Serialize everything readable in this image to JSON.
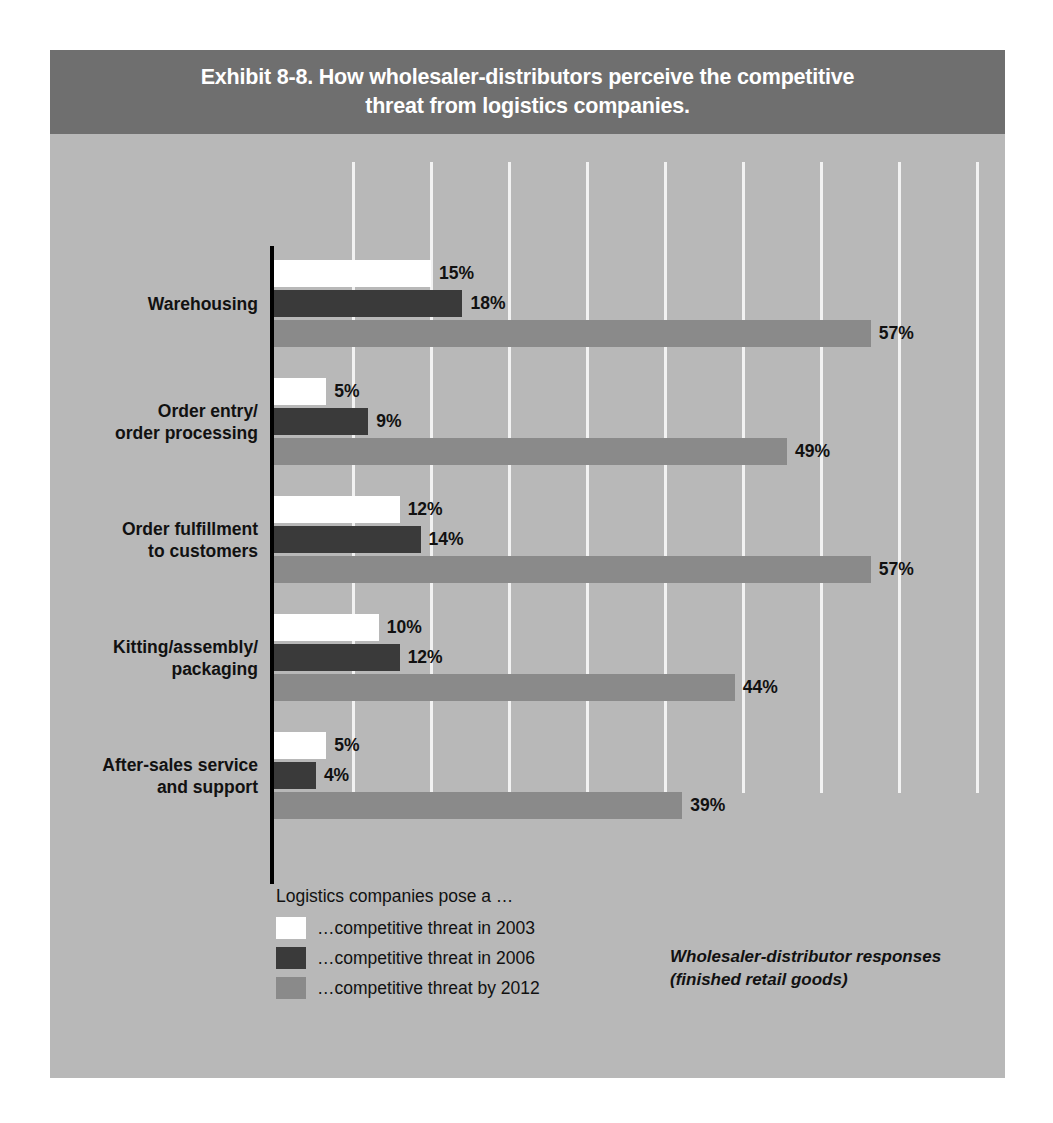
{
  "exhibit": {
    "title": "Exhibit 8-8. How wholesaler-distributors perceive the competitive\nthreat from logistics companies."
  },
  "legend": {
    "title": "Logistics companies pose a …",
    "entries": [
      {
        "key": "s2003",
        "label": "…competitive threat in 2003",
        "color": "#ffffff"
      },
      {
        "key": "s2006",
        "label": "…competitive threat in 2006",
        "color": "#3a3a3a"
      },
      {
        "key": "s2012",
        "label": "…competitive threat by 2012",
        "color": "#8a8a8a"
      }
    ]
  },
  "source_note": "Wholesaler-distributor responses\n(finished retail goods)",
  "colors": {
    "panel_background": "#b8b8b8",
    "title_band": "#6f6f6f",
    "title_text": "#ffffff",
    "gridline": "#f2f2f2",
    "axis": "#000000",
    "series_2003": "#ffffff",
    "series_2006": "#3a3a3a",
    "series_2012": "#8a8a8a",
    "label_text": "#111111"
  },
  "chart_data": {
    "type": "bar",
    "orientation": "horizontal",
    "title": "Exhibit 8-8. How wholesaler-distributors perceive the competitive threat from logistics companies.",
    "xlabel": "",
    "ylabel": "",
    "xlim": [
      0,
      70
    ],
    "grid": true,
    "gridline_count": 9,
    "legend_position": "bottom-left",
    "value_suffix": "%",
    "categories": [
      "Warehousing",
      "Order entry/\norder processing",
      "Order fulfillment\nto customers",
      "Kitting/assembly/\npackaging",
      "After-sales service\nand support"
    ],
    "series": [
      {
        "name": "…competitive threat in 2003",
        "color": "#ffffff",
        "values": [
          15,
          5,
          12,
          10,
          5
        ],
        "labels": [
          "15%",
          "5%",
          "12%",
          "10%",
          "5%"
        ]
      },
      {
        "name": "…competitive threat in 2006",
        "color": "#3a3a3a",
        "values": [
          18,
          9,
          14,
          12,
          4
        ],
        "labels": [
          "18%",
          "9%",
          "14%",
          "12%",
          "4%"
        ]
      },
      {
        "name": "…competitive threat by 2012",
        "color": "#8a8a8a",
        "values": [
          57,
          49,
          57,
          44,
          39
        ],
        "labels": [
          "57%",
          "49%",
          "57%",
          "44%",
          "39%"
        ]
      }
    ],
    "annotations": [
      "Logistics companies pose a …",
      "Wholesaler-distributor responses (finished retail goods)"
    ]
  }
}
